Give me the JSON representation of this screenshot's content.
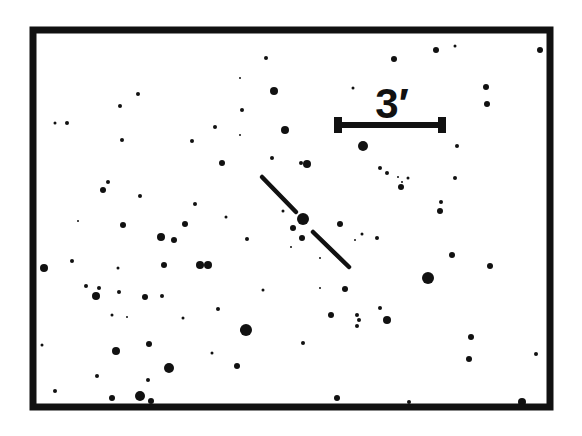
{
  "chart": {
    "frame": {
      "x": 33,
      "y": 30,
      "width": 517,
      "height": 377,
      "stroke": 7,
      "color": "#111111"
    },
    "background": "#ffffff",
    "ink": "#111111",
    "scale_bar": {
      "label": "3′",
      "x1": 336,
      "x2": 444,
      "y": 125,
      "label_x": 392,
      "label_y": 118
    },
    "target_marker": {
      "center": [
        304,
        220
      ],
      "segments": [
        [
          [
            262,
            177
          ],
          [
            296,
            212
          ]
        ],
        [
          [
            313,
            232
          ],
          [
            349,
            267
          ]
        ]
      ]
    },
    "stars": [
      [
        266,
        58,
        2
      ],
      [
        240,
        78,
        1
      ],
      [
        274,
        91,
        4
      ],
      [
        138,
        94,
        2
      ],
      [
        120,
        106,
        2
      ],
      [
        242,
        110,
        2
      ],
      [
        55,
        123,
        1.5
      ],
      [
        67,
        123,
        2
      ],
      [
        215,
        127,
        2
      ],
      [
        240,
        135,
        1
      ],
      [
        285,
        130,
        4
      ],
      [
        122,
        140,
        2
      ],
      [
        192,
        141,
        2
      ],
      [
        222,
        163,
        3
      ],
      [
        272,
        158,
        2
      ],
      [
        301,
        163,
        2
      ],
      [
        307,
        164,
        4
      ],
      [
        436,
        50,
        3
      ],
      [
        455,
        46,
        1.5
      ],
      [
        540,
        50,
        3
      ],
      [
        394,
        59,
        3
      ],
      [
        353,
        88,
        1.5
      ],
      [
        486,
        87,
        3
      ],
      [
        487,
        104,
        3
      ],
      [
        363,
        146,
        5
      ],
      [
        457,
        146,
        2
      ],
      [
        380,
        168,
        2
      ],
      [
        387,
        173,
        2
      ],
      [
        398,
        177,
        1
      ],
      [
        402,
        182,
        1
      ],
      [
        401,
        187,
        3
      ],
      [
        441,
        202,
        2
      ],
      [
        440,
        211,
        3
      ],
      [
        408,
        178,
        1.5
      ],
      [
        455,
        178,
        2
      ],
      [
        108,
        182,
        2
      ],
      [
        103,
        190,
        3
      ],
      [
        140,
        196,
        2
      ],
      [
        195,
        204,
        2
      ],
      [
        78,
        221,
        1
      ],
      [
        123,
        225,
        3
      ],
      [
        185,
        224,
        3
      ],
      [
        161,
        237,
        4
      ],
      [
        174,
        240,
        3
      ],
      [
        303,
        219,
        6
      ],
      [
        293,
        228,
        3
      ],
      [
        302,
        238,
        3
      ],
      [
        283,
        211,
        1.5
      ],
      [
        340,
        224,
        3
      ],
      [
        362,
        234,
        1.5
      ],
      [
        377,
        238,
        2
      ],
      [
        355,
        240,
        1
      ],
      [
        44,
        268,
        4
      ],
      [
        72,
        261,
        2
      ],
      [
        118,
        268,
        1.5
      ],
      [
        164,
        265,
        3
      ],
      [
        200,
        265,
        4
      ],
      [
        208,
        265,
        4
      ],
      [
        247,
        239,
        2
      ],
      [
        291,
        247,
        1
      ],
      [
        428,
        278,
        6
      ],
      [
        452,
        255,
        3
      ],
      [
        490,
        266,
        3
      ],
      [
        86,
        286,
        2
      ],
      [
        99,
        288,
        2
      ],
      [
        96,
        296,
        4
      ],
      [
        119,
        292,
        2
      ],
      [
        145,
        297,
        3
      ],
      [
        162,
        296,
        2
      ],
      [
        112,
        315,
        1.5
      ],
      [
        127,
        317,
        1
      ],
      [
        183,
        318,
        1.5
      ],
      [
        218,
        309,
        2
      ],
      [
        242,
        330,
        2
      ],
      [
        345,
        289,
        3
      ],
      [
        320,
        288,
        1
      ],
      [
        331,
        315,
        3
      ],
      [
        380,
        308,
        2
      ],
      [
        357,
        315,
        2
      ],
      [
        359,
        320,
        2
      ],
      [
        357,
        326,
        2
      ],
      [
        387,
        320,
        4
      ],
      [
        42,
        345,
        1.5
      ],
      [
        116,
        351,
        4
      ],
      [
        149,
        344,
        3
      ],
      [
        169,
        368,
        5
      ],
      [
        246,
        330,
        6
      ],
      [
        237,
        366,
        3
      ],
      [
        97,
        376,
        2
      ],
      [
        148,
        380,
        2
      ],
      [
        55,
        391,
        2
      ],
      [
        112,
        398,
        3
      ],
      [
        140,
        396,
        5
      ],
      [
        151,
        401,
        3
      ],
      [
        337,
        398,
        3
      ],
      [
        471,
        337,
        3
      ],
      [
        469,
        359,
        3
      ],
      [
        536,
        354,
        2
      ],
      [
        409,
        402,
        2
      ],
      [
        522,
        402,
        4
      ],
      [
        303,
        343,
        2
      ],
      [
        263,
        290,
        1.5
      ],
      [
        212,
        353,
        1.5
      ],
      [
        226,
        217,
        1.5
      ],
      [
        320,
        258,
        1
      ]
    ]
  }
}
